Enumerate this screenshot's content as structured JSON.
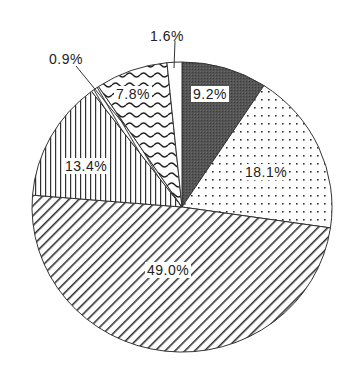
{
  "chart_data": {
    "type": "pie",
    "title": "",
    "start_angle": "12 o'clock",
    "direction": "clockwise",
    "legend": "none",
    "slices": [
      {
        "label": "9.2%",
        "value": 9.2,
        "pattern": "dark-solid"
      },
      {
        "label": "18.1%",
        "value": 18.1,
        "pattern": "dots"
      },
      {
        "label": "49.0%",
        "value": 49.0,
        "pattern": "diagonal-hatch"
      },
      {
        "label": "13.4%",
        "value": 13.4,
        "pattern": "vertical-lines"
      },
      {
        "label": "0.9%",
        "value": 0.9,
        "pattern": "dashed-diagonal"
      },
      {
        "label": "7.8%",
        "value": 7.8,
        "pattern": "waves"
      },
      {
        "label": "1.6%",
        "value": 1.6,
        "pattern": "white"
      }
    ],
    "values": [
      9.2,
      18.1,
      49.0,
      13.4,
      0.9,
      7.8,
      1.6
    ],
    "categories": [
      "9.2%",
      "18.1%",
      "49.0%",
      "13.4%",
      "0.9%",
      "7.8%",
      "1.6%"
    ]
  },
  "labels": {
    "s0": "9.2%",
    "s1": "18.1%",
    "s2": "49.0%",
    "s3": "13.4%",
    "s4": "0.9%",
    "s5": "7.8%",
    "s6": "1.6%"
  },
  "colors": {
    "dark": "#4a4a4a",
    "line": "#333333",
    "background": "#ffffff"
  }
}
